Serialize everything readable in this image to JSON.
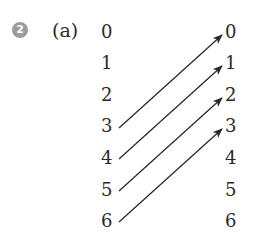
{
  "exercise": {
    "number": "2",
    "part": "(a)"
  },
  "left_column": [
    "0",
    "1",
    "2",
    "3",
    "4",
    "5",
    "6"
  ],
  "right_column": [
    "0",
    "1",
    "2",
    "3",
    "4",
    "5",
    "6"
  ],
  "mappings": [
    {
      "from": "3",
      "to": "0"
    },
    {
      "from": "4",
      "to": "1"
    },
    {
      "from": "5",
      "to": "2"
    },
    {
      "from": "6",
      "to": "3"
    }
  ],
  "colors": {
    "badge": "#9c9c9c",
    "text": "#2a2a2a",
    "arrow": "#2a2a2a"
  }
}
